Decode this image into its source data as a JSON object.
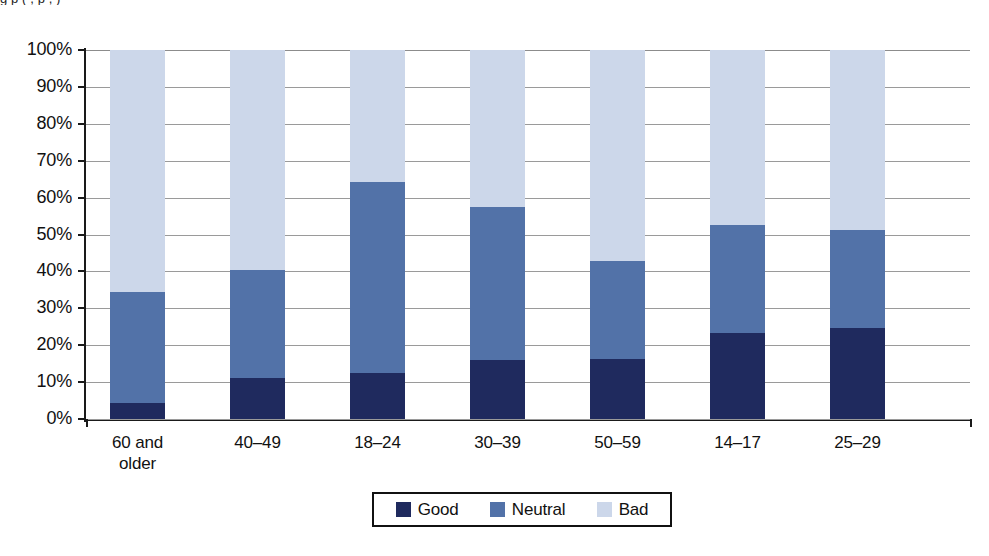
{
  "figure": {
    "clipped_title_fragment": "g  p  (                    ,              p                           ,          )",
    "background_color": "#ffffff"
  },
  "legend": {
    "position": "bottom-center",
    "border_color": "#111111",
    "entries": [
      {
        "label": "Good",
        "color": "#1f2a5e"
      },
      {
        "label": "Neutral",
        "color": "#5272a8"
      },
      {
        "label": "Bad",
        "color": "#ccd7ea"
      }
    ]
  },
  "axes": {
    "y_ticks": [
      "0%",
      "10%",
      "20%",
      "30%",
      "40%",
      "50%",
      "60%",
      "70%",
      "80%",
      "90%",
      "100%"
    ],
    "x_categories": [
      {
        "line1": "60 and",
        "line2": "older"
      },
      {
        "line1": "40–49",
        "line2": ""
      },
      {
        "line1": "18–24",
        "line2": ""
      },
      {
        "line1": "30–39",
        "line2": ""
      },
      {
        "line1": "50–59",
        "line2": ""
      },
      {
        "line1": "14–17",
        "line2": ""
      },
      {
        "line1": "25–29",
        "line2": ""
      }
    ]
  },
  "chart_data": {
    "type": "bar",
    "subtype": "stacked-percentage",
    "title": "",
    "xlabel": "",
    "ylabel": "",
    "ylim": [
      0,
      100
    ],
    "ytick_values": [
      0,
      10,
      20,
      30,
      40,
      50,
      60,
      70,
      80,
      90,
      100
    ],
    "ytick_labels": [
      "0%",
      "10%",
      "20%",
      "30%",
      "40%",
      "50%",
      "60%",
      "70%",
      "80%",
      "90%",
      "100%"
    ],
    "grid": true,
    "grid_axis": "y",
    "legend_position": "bottom",
    "categories": [
      "60 and older",
      "40–49",
      "18–24",
      "30–39",
      "50–59",
      "14–17",
      "25–29"
    ],
    "series": [
      {
        "name": "Good",
        "color": "#1f2a5e",
        "values": [
          4.3,
          11.1,
          12.5,
          16.0,
          16.3,
          23.3,
          24.7
        ]
      },
      {
        "name": "Neutral",
        "color": "#5272a8",
        "values": [
          30.1,
          29.3,
          51.7,
          41.5,
          26.5,
          29.3,
          26.5
        ]
      },
      {
        "name": "Bad",
        "color": "#ccd7ea",
        "values": [
          65.6,
          59.6,
          35.8,
          42.5,
          57.2,
          47.4,
          48.8
        ]
      }
    ],
    "cumulative_tops": {
      "good": [
        4.3,
        11.1,
        12.5,
        16.0,
        16.3,
        23.3,
        24.7
      ],
      "neutral": [
        34.4,
        40.4,
        64.2,
        57.5,
        42.8,
        52.6,
        51.2
      ],
      "bad": [
        100,
        100,
        100,
        100,
        100,
        100,
        100
      ]
    }
  }
}
